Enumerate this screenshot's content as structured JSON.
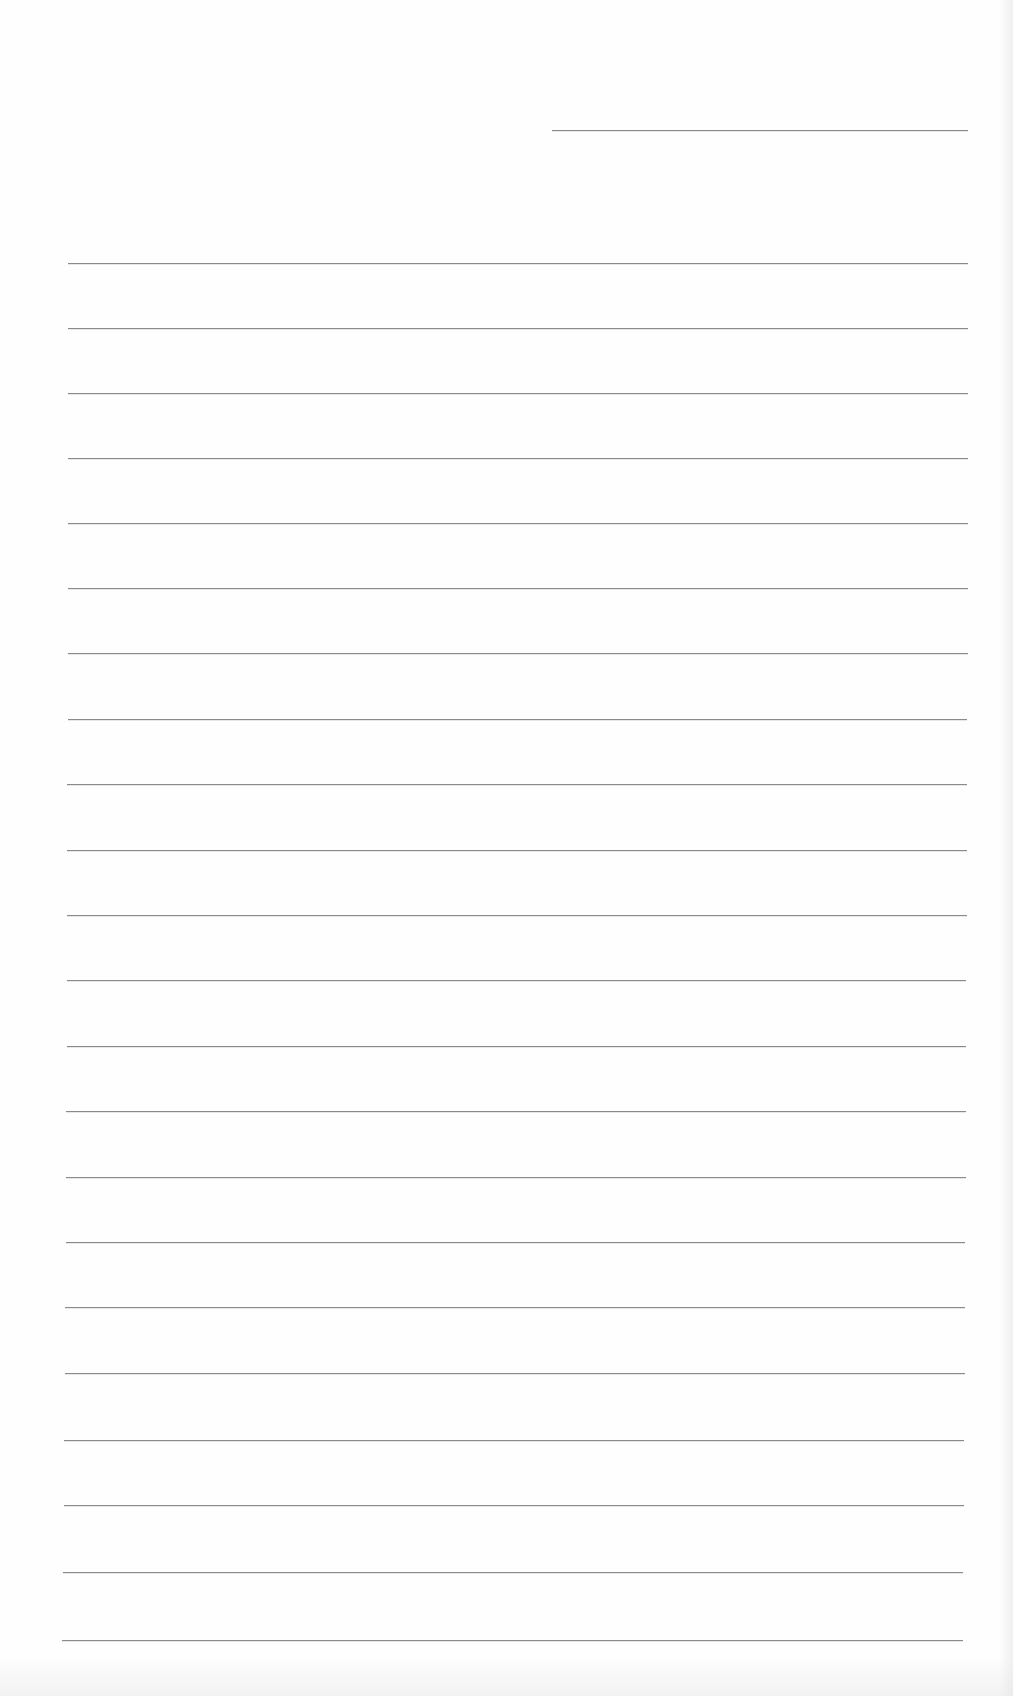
{
  "document": {
    "type": "lined-paper",
    "background_color": "#fefefe",
    "rule_color": "#8a8a8a",
    "header_rule": {
      "top": 130,
      "left": 552,
      "right": 968
    },
    "rules": [
      {
        "top": 263,
        "left": 68,
        "right": 968
      },
      {
        "top": 328,
        "left": 68,
        "right": 968
      },
      {
        "top": 393,
        "left": 68,
        "right": 968
      },
      {
        "top": 458,
        "left": 68,
        "right": 968
      },
      {
        "top": 523,
        "left": 68,
        "right": 968
      },
      {
        "top": 588,
        "left": 68,
        "right": 968
      },
      {
        "top": 653,
        "left": 68,
        "right": 968
      },
      {
        "top": 719,
        "left": 68,
        "right": 967
      },
      {
        "top": 784,
        "left": 67,
        "right": 967
      },
      {
        "top": 850,
        "left": 67,
        "right": 967
      },
      {
        "top": 915,
        "left": 67,
        "right": 967
      },
      {
        "top": 980,
        "left": 67,
        "right": 966
      },
      {
        "top": 1046,
        "left": 67,
        "right": 966
      },
      {
        "top": 1111,
        "left": 66,
        "right": 966
      },
      {
        "top": 1177,
        "left": 66,
        "right": 966
      },
      {
        "top": 1242,
        "left": 66,
        "right": 965
      },
      {
        "top": 1307,
        "left": 65,
        "right": 965
      },
      {
        "top": 1373,
        "left": 65,
        "right": 965
      },
      {
        "top": 1440,
        "left": 64,
        "right": 964
      },
      {
        "top": 1505,
        "left": 64,
        "right": 964
      },
      {
        "top": 1572,
        "left": 63,
        "right": 963
      },
      {
        "top": 1640,
        "left": 62,
        "right": 963
      }
    ]
  }
}
